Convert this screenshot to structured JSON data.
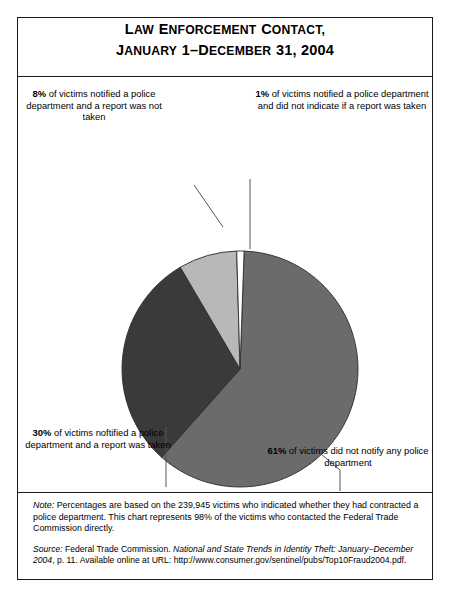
{
  "title": {
    "line1": "Law Enforcement Contact,",
    "line2": "January 1–December 31, 2004"
  },
  "callouts": {
    "pct8": {
      "pct": "8%",
      "rest": " of victims notified a police department and a report was not taken"
    },
    "pct1": {
      "pct": "1%",
      "rest": " of victims notified a police department and did not indicate if a report was taken"
    },
    "pct30": {
      "pct": "30%",
      "rest": " of victims noftified a police department and a report was taken"
    },
    "pct61": {
      "pct": "61%",
      "rest": " of victims did not notify any police department"
    }
  },
  "notes": {
    "note_label": "Note:",
    "note_text": " Percentages are based on the 239,945 victims who indicated whether they had contracted a police department.  This chart represents 98% of the victims who contacted the Federal Trade Commission directly.",
    "source_label": "Source:",
    "source_pre": " Federal Trade Commission. ",
    "source_italic": "National and State Trends in Identity Theft: January–December 2004",
    "source_post": ", p. 11. Available online at URL: http://www.consumer.gov/sentinel/pubs/Top10Fraud2004.pdf."
  },
  "chart_data": {
    "type": "pie",
    "title": "Law Enforcement Contact, January 1–December 31, 2004",
    "categories": [
      "Did not notify any police department",
      "Notified a police department and a report was taken",
      "Notified a police department and a report was not taken",
      "Notified a police department and did not indicate if a report was taken"
    ],
    "values": [
      61,
      30,
      8,
      1
    ],
    "labels": [
      "61%",
      "30%",
      "8%",
      "1%"
    ],
    "colors": [
      "#6b6b6b",
      "#3a3a3a",
      "#b8b8b8",
      "#ffffff"
    ],
    "units": "percent of victims",
    "total_respondents": 239945,
    "start_angle_deg": 2,
    "direction": "clockwise",
    "legend": "none",
    "labels_position": "outside-with-leader-lines",
    "geometry": {
      "cx": 222,
      "cy": 292,
      "r": 118
    }
  }
}
